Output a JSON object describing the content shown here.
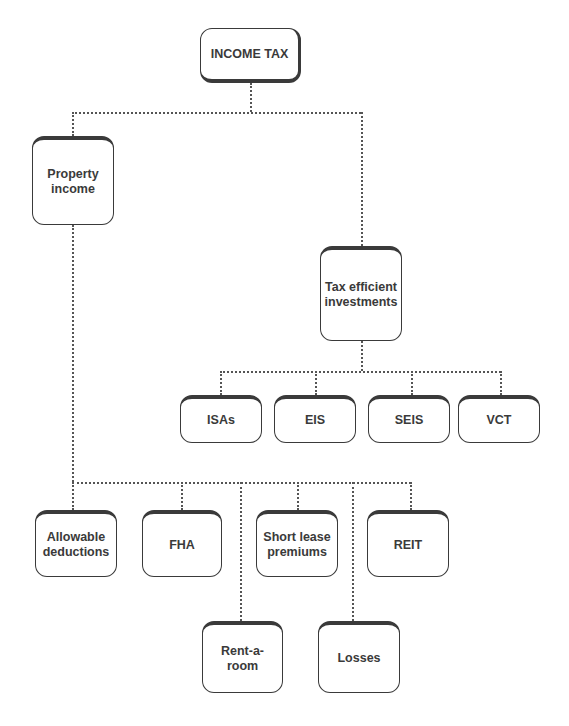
{
  "diagram": {
    "type": "hierarchy-tree",
    "connector_style": "dotted",
    "colors": {
      "box_border": "#3a3a3a",
      "box_text": "#3a3a3a",
      "connector": "#555555",
      "background": "#ffffff"
    },
    "root": {
      "id": "income-tax",
      "label": "INCOME TAX"
    },
    "level1": [
      {
        "id": "property-income",
        "label": "Property income"
      },
      {
        "id": "tax-efficient-investments",
        "label": "Tax efficient investments"
      }
    ],
    "tax_efficient_children": [
      {
        "id": "isas",
        "label": "ISAs"
      },
      {
        "id": "eis",
        "label": "EIS"
      },
      {
        "id": "seis",
        "label": "SEIS"
      },
      {
        "id": "vct",
        "label": "VCT"
      }
    ],
    "property_income_children": [
      {
        "id": "allowable-deductions",
        "label": "Allowable deductions"
      },
      {
        "id": "fha",
        "label": "FHA"
      },
      {
        "id": "short-lease-premiums",
        "label": "Short lease premiums"
      },
      {
        "id": "reit",
        "label": "REIT"
      },
      {
        "id": "rent-a-room",
        "label": "Rent-a-room"
      },
      {
        "id": "losses",
        "label": "Losses"
      }
    ],
    "edges": [
      [
        "income-tax",
        "property-income"
      ],
      [
        "income-tax",
        "tax-efficient-investments"
      ],
      [
        "tax-efficient-investments",
        "isas"
      ],
      [
        "tax-efficient-investments",
        "eis"
      ],
      [
        "tax-efficient-investments",
        "seis"
      ],
      [
        "tax-efficient-investments",
        "vct"
      ],
      [
        "property-income",
        "allowable-deductions"
      ],
      [
        "property-income",
        "fha"
      ],
      [
        "property-income",
        "short-lease-premiums"
      ],
      [
        "property-income",
        "reit"
      ],
      [
        "property-income",
        "rent-a-room"
      ],
      [
        "property-income",
        "losses"
      ]
    ]
  }
}
